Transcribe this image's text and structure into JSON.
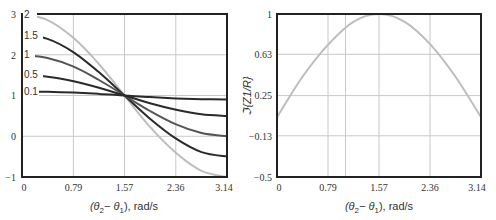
{
  "chart_data": [
    {
      "type": "line",
      "title": "",
      "xlabel": "(θ2−θ1), rad/s",
      "ylabel": "",
      "xlim": [
        0,
        3.14
      ],
      "ylim": [
        -1,
        3
      ],
      "xticks": [
        "0",
        "0.79",
        "1.57",
        "2.36",
        "3.14"
      ],
      "yticks": [
        "−1",
        "0",
        "1",
        "2",
        "3"
      ],
      "grid": true,
      "legend": "inline labels at left",
      "x": [
        0,
        0.39,
        0.79,
        1.18,
        1.57,
        1.96,
        2.36,
        2.75,
        3.14
      ],
      "series": [
        {
          "name": "0.1",
          "values": [
            1.1,
            1.09,
            1.07,
            1.04,
            1.0,
            0.96,
            0.93,
            0.91,
            0.9
          ]
        },
        {
          "name": "0.5",
          "values": [
            1.5,
            1.46,
            1.35,
            1.19,
            1.0,
            0.81,
            0.65,
            0.54,
            0.5
          ]
        },
        {
          "name": "1",
          "values": [
            2.0,
            1.92,
            1.71,
            1.38,
            1.0,
            0.62,
            0.29,
            0.08,
            0.0
          ]
        },
        {
          "name": "1.5",
          "values": [
            2.5,
            2.39,
            2.06,
            1.57,
            1.0,
            0.43,
            -0.06,
            -0.39,
            -0.5
          ]
        },
        {
          "name": "2",
          "values": [
            3.0,
            2.85,
            2.41,
            1.77,
            1.0,
            0.23,
            -0.41,
            -0.85,
            -1.0
          ]
        }
      ]
    },
    {
      "type": "line",
      "title": "",
      "xlabel": "(θ2−θ1), rad/s",
      "ylabel": "ℑ{Z1/R}",
      "xlim": [
        0,
        3.14
      ],
      "ylim": [
        -0.5,
        1
      ],
      "xticks": [
        "0",
        "0.79",
        "1.57",
        "2.36",
        "3.14"
      ],
      "yticks": [
        "−0.5",
        "−0.13",
        "0.25",
        "0.63",
        "1"
      ],
      "grid": true,
      "x": [
        0,
        0.39,
        0.79,
        1.18,
        1.57,
        1.96,
        2.36,
        2.75,
        3.14
      ],
      "series": [
        {
          "name": "Im(Z1/R)",
          "values": [
            0.05,
            0.42,
            0.72,
            0.93,
            1.0,
            0.93,
            0.72,
            0.42,
            0.05
          ]
        }
      ]
    }
  ],
  "left": {
    "xlabel_pre": "(θ",
    "xlabel_sub1": "2",
    "xlabel_mid": "− θ",
    "xlabel_sub2": "1",
    "xlabel_post": "), rad/s",
    "xticks": [
      "0",
      "0.79",
      "1.57",
      "2.36",
      "3.14"
    ],
    "yticks": [
      "−1",
      "0",
      "1",
      "2",
      "3"
    ],
    "curve_labels": [
      "2",
      "1.5",
      "1",
      "0.5",
      "0.1"
    ]
  },
  "right": {
    "xlabel_pre": "(θ",
    "xlabel_sub1": "2",
    "xlabel_mid": "− θ",
    "xlabel_sub2": "1",
    "xlabel_post": "), rad/s",
    "ylabel": "ℑ{Z1/R}",
    "xticks": [
      "0",
      "0.79",
      "1.57",
      "2.36",
      "3.14"
    ],
    "yticks": [
      "−0.5",
      "−0.13",
      "0.25",
      "0.63",
      "1"
    ]
  }
}
